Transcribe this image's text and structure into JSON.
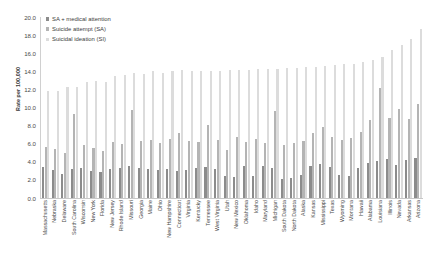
{
  "chart_data": {
    "type": "bar",
    "title": "",
    "subtitle": "",
    "xlabel": "",
    "ylabel": "Rate per 100,000",
    "ylim": [
      0.0,
      20.0
    ],
    "ytick_step": 2.0,
    "ytick_labels": [
      "20.0",
      "18.0",
      "16.0",
      "14.0",
      "12.0",
      "10.0",
      "8.0",
      "6.0",
      "4.0",
      "2.0",
      "0.0"
    ],
    "ytick_values": [
      20.0,
      18.0,
      16.0,
      14.0,
      12.0,
      10.0,
      8.0,
      6.0,
      4.0,
      2.0,
      0.0
    ],
    "grid": false,
    "legend_position": "top-left",
    "orientation": "vertical",
    "bar_group_order": [
      "SA + medical attention",
      "Suicide attempt (SA)",
      "Suicidal ideation (SI)"
    ],
    "colors": {
      "SA + medical attention": "#8c8c8c",
      "Suicide attempt (SA)": "#b4b4b4",
      "Suicidal ideation (SI)": "#dcdcdc"
    },
    "categories": [
      "Massachusetts",
      "Nebraska",
      "Delaware",
      "South Carolina",
      "Wisconsin",
      "New York",
      "Florida",
      "New Jersey",
      "Rhode Island",
      "Missouri",
      "Georgia",
      "Maine",
      "Ohio",
      "New Hampshire",
      "Connecticut",
      "Virginia",
      "Kentucky",
      "Tennessee",
      "West Virginia",
      "Utah",
      "New Mexico",
      "Oklahoma",
      "Idaho",
      "Maryland",
      "Michigan",
      "South Dakota",
      "North Dakota",
      "Alaska",
      "Kansas",
      "Mississippi",
      "Texas",
      "Wyoming",
      "Montana",
      "Hawaii",
      "Alabama",
      "Louisiana",
      "Illinois",
      "Nevada",
      "Arkansas",
      "Arizona"
    ],
    "series": [
      {
        "name": "SA + medical attention",
        "values": [
          3.4,
          3.1,
          2.7,
          3.2,
          3.3,
          3.0,
          2.9,
          3.2,
          3.3,
          3.5,
          3.3,
          3.2,
          3.1,
          3.2,
          3.0,
          3.1,
          3.3,
          3.4,
          3.2,
          2.4,
          2.3,
          3.6,
          2.4,
          3.5,
          3.3,
          2.1,
          2.2,
          2.5,
          3.6,
          3.8,
          3.4,
          2.6,
          2.4,
          3.3,
          3.9,
          4.1,
          4.3,
          3.7,
          4.2,
          4.4
        ]
      },
      {
        "name": "Suicide attempt (SA)",
        "values": [
          5.6,
          5.4,
          5.0,
          9.3,
          5.9,
          5.5,
          5.2,
          6.2,
          6.0,
          9.7,
          6.3,
          6.4,
          6.1,
          6.5,
          7.2,
          6.3,
          6.2,
          8.1,
          6.4,
          5.3,
          6.8,
          6.2,
          6.5,
          6.1,
          9.6,
          5.9,
          6.1,
          6.3,
          7.2,
          7.9,
          6.8,
          6.4,
          6.6,
          7.3,
          8.6,
          12.2,
          8.9,
          9.9,
          8.7,
          10.4
        ]
      },
      {
        "name": "Suicidal ideation (SI)",
        "values": [
          11.9,
          11.9,
          12.3,
          12.3,
          12.9,
          13.0,
          12.9,
          13.5,
          13.6,
          13.8,
          13.7,
          14.1,
          13.9,
          14.1,
          14.2,
          14.1,
          14.1,
          14.1,
          14.1,
          14.2,
          14.2,
          14.2,
          14.3,
          14.3,
          14.3,
          14.4,
          14.4,
          14.5,
          14.5,
          14.6,
          14.7,
          14.8,
          14.9,
          15.1,
          15.3,
          15.6,
          16.4,
          17.0,
          17.6,
          18.7
        ]
      }
    ]
  },
  "legend": {
    "entries": [
      {
        "label": "SA + medical attention",
        "color": "#8c8c8c"
      },
      {
        "label": "Suicide attempt (SA)",
        "color": "#b4b4b4"
      },
      {
        "label": "Suicidal ideation (SI)",
        "color": "#dcdcdc"
      }
    ]
  },
  "axes": {
    "y_title": "Rate per 100,000"
  }
}
